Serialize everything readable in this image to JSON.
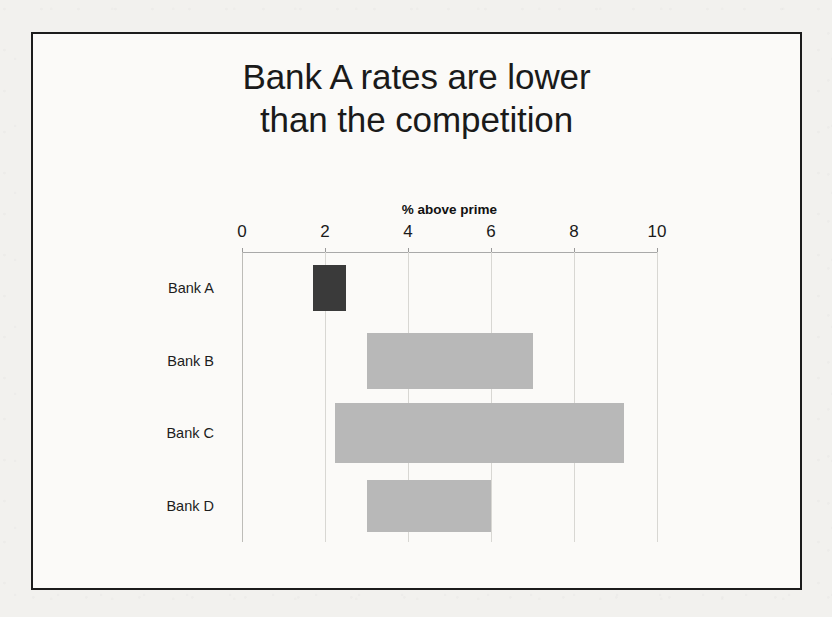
{
  "slide": {
    "title_line1": "Bank A rates are lower",
    "title_line2": "than the competition"
  },
  "chart_data": {
    "type": "bar",
    "orientation": "horizontal",
    "bar_style": "floating-range",
    "title": "Bank A rates are lower than the competition",
    "xlabel": "% above prime",
    "ylabel": "",
    "xlim": [
      0,
      10
    ],
    "xticks": [
      0,
      2,
      4,
      6,
      8,
      10
    ],
    "xticklabels": [
      "0",
      "2",
      "4",
      "6",
      "8",
      "10"
    ],
    "axis_position": "top",
    "grid": "vertical",
    "legend": "none",
    "categories": [
      "Bank A",
      "Bank B",
      "Bank C",
      "Bank D"
    ],
    "series": [
      {
        "name": "% above prime range",
        "start": [
          1.7,
          3.0,
          2.25,
          3.0
        ],
        "end": [
          2.5,
          7.0,
          9.2,
          6.0
        ]
      }
    ],
    "bars": [
      {
        "category": "Bank A",
        "start": 1.7,
        "end": 2.5,
        "color": "#3a3a3a",
        "highlighted": true
      },
      {
        "category": "Bank B",
        "start": 3.0,
        "end": 7.0,
        "color": "#b8b8b8",
        "highlighted": false
      },
      {
        "category": "Bank C",
        "start": 2.25,
        "end": 9.2,
        "color": "#b8b8b8",
        "highlighted": false
      },
      {
        "category": "Bank D",
        "start": 3.0,
        "end": 6.0,
        "color": "#b8b8b8",
        "highlighted": false
      }
    ],
    "colors": {
      "highlight_bar": "#3a3a3a",
      "default_bar": "#b8b8b8",
      "gridline": "#d8d7d3",
      "axis": "#a9a9a9",
      "text": "#1a1a1a"
    }
  }
}
